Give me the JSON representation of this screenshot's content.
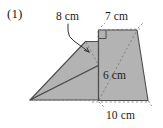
{
  "figure": {
    "item_number": "(1)",
    "background_color": "#ffffff",
    "fill_color": "#b3b3b3",
    "stroke_color": "#4d4d4d",
    "dash_color": "#808080",
    "text_color": "#1a1a1a",
    "labels": {
      "slant_height": "8 cm",
      "top_edge": "7 cm",
      "vertical_height": "6 cm",
      "base_edge": "10 cm"
    },
    "shapes": [
      {
        "name": "left-parallelogram",
        "points": "30,100 85,42 98,42 98,65"
      },
      {
        "name": "right-trapezoid",
        "points": "98,30 137,30 148,100 98,100"
      }
    ],
    "markers": {
      "right_angle_at": "98,30"
    },
    "dimensions": {
      "width": 163,
      "height": 128
    }
  }
}
